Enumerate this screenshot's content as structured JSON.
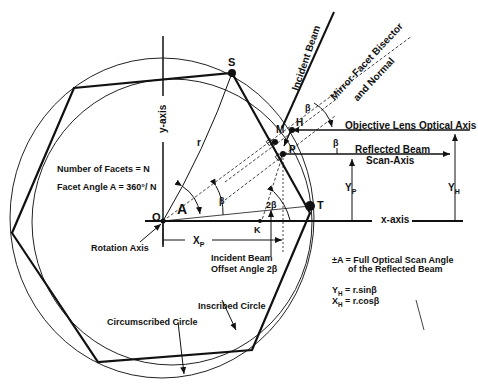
{
  "labels": {
    "incident_beam": "Incident Beam",
    "mirror_bisector_1": "Mirror-Facet Bisector",
    "mirror_bisector_2": "and Normal",
    "objective_axis": "Objective Lens Optical Axis",
    "reflected_beam": "Reflected Beam",
    "scan_axis": "Scan-Axis",
    "y_axis": "y-axis",
    "x_axis": "x-axis",
    "num_facets": "Number of Facets = N",
    "facet_angle": "Facet Angle A = 360°/ N",
    "rotation_axis": "Rotation Axis",
    "incident_offset_1": "Incident Beam",
    "incident_offset_2": "Offset Angle 2β",
    "inscribed_circle": "Inscribed Circle",
    "circumscribed_circle": "Circumscribed Circle",
    "scan_angle_1": "±A = Full Optical Scan Angle",
    "scan_angle_2": "of the Reflected Beam",
    "yh_formula": "= r.sinβ",
    "xh_formula": "= r.cosβ"
  },
  "points": {
    "S": "S",
    "T": "T",
    "M": "M",
    "H": "H",
    "P": "P",
    "O": "O",
    "K": "K",
    "A": "A",
    "r": "r",
    "beta": "β",
    "two_beta": "2β",
    "YP_main": "Y",
    "YP_sub": "P",
    "YH_main": "Y",
    "YH_sub": "H",
    "XP_main": "X",
    "XP_sub": "P",
    "XH_main": "X",
    "XH_sub": "H"
  }
}
